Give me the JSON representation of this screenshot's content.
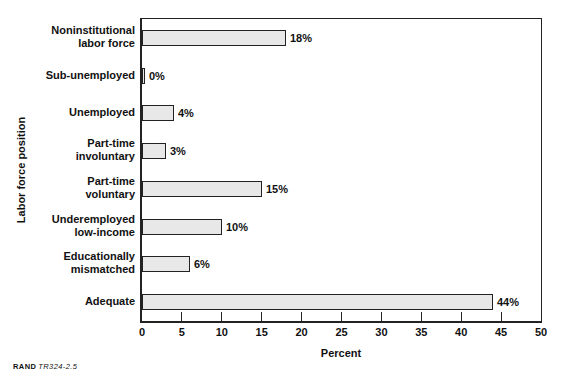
{
  "chart_data": {
    "type": "bar",
    "orientation": "horizontal",
    "xlabel": "Percent",
    "ylabel": "Labor force position",
    "xlim": [
      0,
      50
    ],
    "x_ticks": [
      0,
      5,
      10,
      15,
      20,
      25,
      30,
      35,
      40,
      45,
      50
    ],
    "grid": false,
    "categories": [
      "Noninstitutional\nlabor force",
      "Sub-unemployed",
      "Unemployed",
      "Part-time\ninvoluntary",
      "Part-time\nvoluntary",
      "Underemployed\nlow-income",
      "Educationally\nmismatched",
      "Adequate"
    ],
    "values": [
      18,
      0,
      4,
      3,
      15,
      10,
      6,
      44
    ],
    "value_labels": [
      "18%",
      "0%",
      "4%",
      "3%",
      "15%",
      "10%",
      "6%",
      "44%"
    ],
    "colors": {
      "bar_fill": "#e8e8e8",
      "bar_border": "#222222",
      "axis": "#222222",
      "text": "#111111"
    }
  },
  "source": {
    "brand": "RAND",
    "figure_id": "TR324-2.5"
  }
}
